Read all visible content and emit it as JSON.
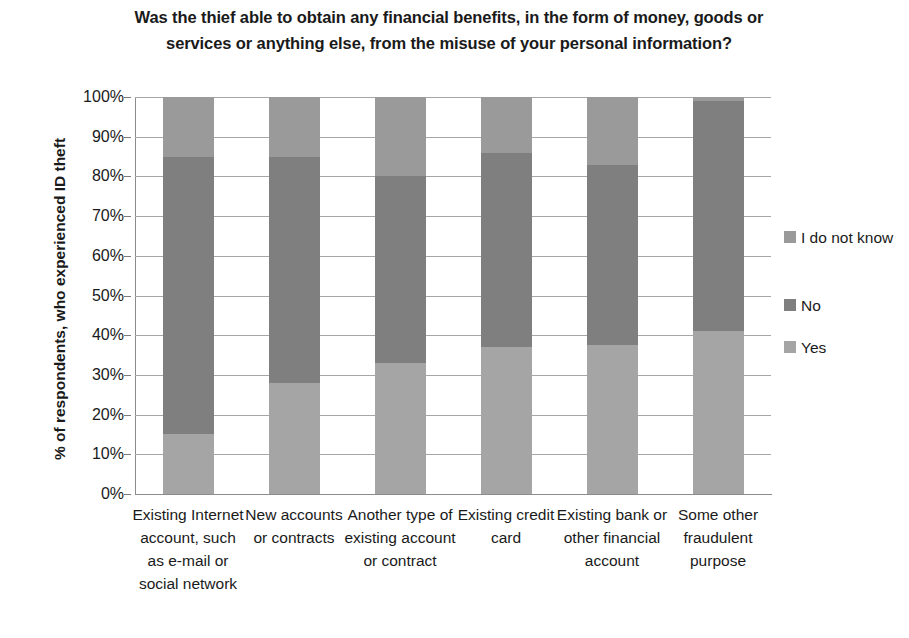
{
  "chart_data": {
    "type": "bar",
    "subtype": "stacked-column-100",
    "title": "Was the thief able to obtain any financial benefits, in the form of money, goods or services or anything else, from the misuse of your personal information?",
    "xlabel": "",
    "ylabel": "% of respondents, who experienced ID theft",
    "ylim": [
      0,
      100
    ],
    "ytick_labels": [
      "100%",
      "90%",
      "80%",
      "70%",
      "60%",
      "50%",
      "40%",
      "30%",
      "20%",
      "10%",
      "0%"
    ],
    "ytick_values": [
      100,
      90,
      80,
      70,
      60,
      50,
      40,
      30,
      20,
      10,
      0
    ],
    "grid": true,
    "legend_position": "right",
    "categories": [
      "Existing Internet account, such as e-mail or social network",
      "New accounts or contracts",
      "Another type of existing account or contract",
      "Existing credit card",
      "Existing bank or other financial account",
      "Some other fraudulent purpose"
    ],
    "series": [
      {
        "name": "Yes",
        "color": "#a5a5a5",
        "values": [
          15,
          28,
          33,
          37,
          37.5,
          41
        ]
      },
      {
        "name": "No",
        "color": "#7f7f7f",
        "values": [
          70,
          57,
          47,
          49,
          45.5,
          58
        ]
      },
      {
        "name": "I do not know",
        "color": "#9a9a9a",
        "values": [
          15,
          15,
          20,
          14,
          17,
          1
        ]
      }
    ],
    "stack_order_bottom_to_top": [
      "Yes",
      "No",
      "I do not know"
    ]
  },
  "legend": {
    "items": [
      {
        "label": "I do not know",
        "color": "#9a9a9a"
      },
      {
        "label": "No",
        "color": "#7f7f7f"
      },
      {
        "label": "Yes",
        "color": "#a5a5a5"
      }
    ]
  }
}
